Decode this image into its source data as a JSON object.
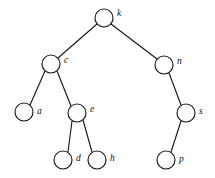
{
  "diagram": {
    "type": "binary-tree",
    "background_color": "#ffffff",
    "stroke_color": "#1a1a1a",
    "node_fill_color": "#ffffff",
    "node_radius": 9,
    "nodes": [
      {
        "id": "k",
        "label": "k",
        "cx": 104,
        "cy": 18,
        "label_x": 117,
        "label_y": 14
      },
      {
        "id": "c",
        "label": "c",
        "cx": 51,
        "cy": 64,
        "label_x": 64,
        "label_y": 61
      },
      {
        "id": "n",
        "label": "n",
        "cx": 164,
        "cy": 65,
        "label_x": 177,
        "label_y": 62
      },
      {
        "id": "a",
        "label": "a",
        "cx": 24,
        "cy": 112,
        "label_x": 37,
        "label_y": 112
      },
      {
        "id": "e",
        "label": "e",
        "cx": 77,
        "cy": 113,
        "label_x": 90,
        "label_y": 110
      },
      {
        "id": "s",
        "label": "s",
        "cx": 186,
        "cy": 113,
        "label_x": 199,
        "label_y": 112
      },
      {
        "id": "d",
        "label": "d",
        "cx": 63,
        "cy": 160,
        "label_x": 76,
        "label_y": 159
      },
      {
        "id": "h",
        "label": "h",
        "cx": 97,
        "cy": 160,
        "label_x": 110,
        "label_y": 159
      },
      {
        "id": "p",
        "label": "p",
        "cx": 166,
        "cy": 160,
        "label_x": 179,
        "label_y": 160
      }
    ],
    "edges": [
      {
        "id": "k-c",
        "from": "k",
        "to": "c",
        "x1": 97,
        "y1": 24,
        "x2": 58,
        "y2": 58
      },
      {
        "id": "k-n",
        "from": "k",
        "to": "n",
        "x1": 111,
        "y1": 24,
        "x2": 157,
        "y2": 59
      },
      {
        "id": "c-a",
        "from": "c",
        "to": "a",
        "x1": 45,
        "y1": 71,
        "x2": 30,
        "y2": 105
      },
      {
        "id": "c-e",
        "from": "c",
        "to": "e",
        "x1": 57,
        "y1": 71,
        "x2": 71,
        "y2": 106
      },
      {
        "id": "n-s",
        "from": "n",
        "to": "s",
        "x1": 169,
        "y1": 73,
        "x2": 181,
        "y2": 105
      },
      {
        "id": "e-d",
        "from": "e",
        "to": "d",
        "x1": 72,
        "y1": 121,
        "x2": 68,
        "y2": 152
      },
      {
        "id": "e-h",
        "from": "e",
        "to": "h",
        "x1": 83,
        "y1": 120,
        "x2": 92,
        "y2": 152
      },
      {
        "id": "s-p",
        "from": "s",
        "to": "p",
        "x1": 181,
        "y1": 121,
        "x2": 171,
        "y2": 152
      }
    ],
    "tree_structure": {
      "root": "k",
      "children": {
        "k": {
          "left": "c",
          "right": "n"
        },
        "c": {
          "left": "a",
          "right": "e"
        },
        "n": {
          "left": null,
          "right": "s"
        },
        "e": {
          "left": "d",
          "right": "h"
        },
        "s": {
          "left": "p",
          "right": null
        },
        "a": {
          "left": null,
          "right": null
        },
        "d": {
          "left": null,
          "right": null
        },
        "h": {
          "left": null,
          "right": null
        },
        "p": {
          "left": null,
          "right": null
        }
      }
    }
  }
}
